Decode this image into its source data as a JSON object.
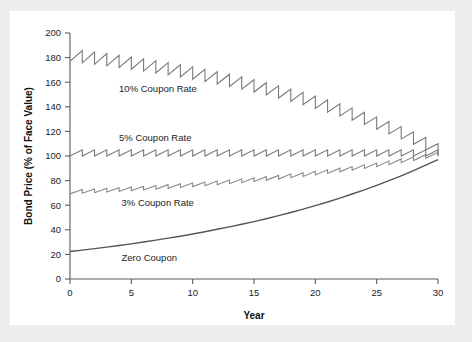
{
  "figure": {
    "panel_background": "#ffffff",
    "page_background": "#eceef0"
  },
  "chart_data": {
    "type": "line",
    "title": "",
    "subtitle": "",
    "xlabel": "Year",
    "ylabel": "Bond Price (% of Face Value)",
    "xlim": [
      0,
      30
    ],
    "ylim": [
      0,
      200
    ],
    "xticks": [
      0,
      5,
      10,
      15,
      20,
      25,
      30
    ],
    "xtick_labels": [
      "0",
      "5",
      "10",
      "15",
      "20",
      "25",
      "30"
    ],
    "yticks": [
      0,
      20,
      40,
      60,
      80,
      100,
      120,
      140,
      160,
      180,
      200
    ],
    "ytick_labels": [
      "0",
      "20",
      "40",
      "60",
      "80",
      "100",
      "120",
      "140",
      "160",
      "180",
      "200"
    ],
    "grid": false,
    "legend_position": "inline-annotations",
    "axis_color": "#5a5a5a",
    "series": [
      {
        "name": "10% Coupon Rate",
        "label": "10% Coupon Rate",
        "color": "#7a7a7a",
        "line_width": 1.1,
        "style": "sawtooth",
        "coupon_rate": 10,
        "yield": 5,
        "face_value": 100,
        "label_x": 4.0,
        "label_y": 152,
        "x": [
          0,
          1,
          2,
          3,
          4,
          5,
          6,
          7,
          8,
          9,
          10,
          11,
          12,
          13,
          14,
          15,
          16,
          17,
          18,
          19,
          20,
          21,
          22,
          23,
          24,
          25,
          26,
          27,
          28,
          29,
          30
        ],
        "values": [
          176.9,
          175.7,
          174.5,
          173.3,
          171.9,
          170.5,
          169.0,
          167.5,
          165.9,
          164.2,
          162.4,
          160.5,
          158.5,
          156.5,
          154.3,
          152.0,
          149.6,
          147.1,
          144.4,
          141.7,
          138.7,
          135.7,
          132.5,
          129.1,
          125.6,
          121.8,
          118.0,
          113.9,
          109.5,
          105.0,
          100.0
        ],
        "ex_coupon_values": [
          176.9,
          185.7,
          184.5,
          183.3,
          181.9,
          180.5,
          179.0,
          177.5,
          175.9,
          174.2,
          172.4,
          170.5,
          168.5,
          166.5,
          164.3,
          162.0,
          159.6,
          157.1,
          154.4,
          151.7,
          148.7,
          145.7,
          142.5,
          139.1,
          135.6,
          131.8,
          128.0,
          123.9,
          119.5,
          115.0,
          110.0
        ]
      },
      {
        "name": "5% Coupon Rate",
        "label": "5% Coupon Rate",
        "color": "#7a7a7a",
        "line_width": 1.1,
        "style": "sawtooth",
        "coupon_rate": 5,
        "yield": 5,
        "face_value": 100,
        "label_x": 4.0,
        "label_y": 112,
        "x": [
          0,
          1,
          2,
          3,
          4,
          5,
          6,
          7,
          8,
          9,
          10,
          11,
          12,
          13,
          14,
          15,
          16,
          17,
          18,
          19,
          20,
          21,
          22,
          23,
          24,
          25,
          26,
          27,
          28,
          29,
          30
        ],
        "values": [
          100,
          100,
          100,
          100,
          100,
          100,
          100,
          100,
          100,
          100,
          100,
          100,
          100,
          100,
          100,
          100,
          100,
          100,
          100,
          100,
          100,
          100,
          100,
          100,
          100,
          100,
          100,
          100,
          100,
          100,
          100
        ],
        "ex_coupon_values": [
          100,
          105,
          105,
          105,
          105,
          105,
          105,
          105,
          105,
          105,
          105,
          105,
          105,
          105,
          105,
          105,
          105,
          105,
          105,
          105,
          105,
          105,
          105,
          105,
          105,
          105,
          105,
          105,
          105,
          105,
          105
        ]
      },
      {
        "name": "3% Coupon Rate",
        "label": "3% Coupon Rate",
        "color": "#8a8a8a",
        "line_width": 1.1,
        "style": "sawtooth",
        "coupon_rate": 3,
        "yield": 5,
        "face_value": 100,
        "label_x": 4.2,
        "label_y": 59,
        "x": [
          0,
          1,
          2,
          3,
          4,
          5,
          6,
          7,
          8,
          9,
          10,
          11,
          12,
          13,
          14,
          15,
          16,
          17,
          18,
          19,
          20,
          21,
          22,
          23,
          24,
          25,
          26,
          27,
          28,
          29,
          30
        ],
        "values": [
          69.2,
          69.7,
          70.2,
          70.7,
          71.2,
          71.8,
          72.4,
          73.0,
          73.7,
          74.4,
          75.1,
          75.8,
          76.6,
          77.5,
          78.3,
          79.3,
          80.2,
          81.2,
          82.3,
          83.4,
          84.6,
          85.8,
          87.1,
          88.4,
          89.9,
          91.3,
          92.9,
          94.6,
          96.3,
          98.1,
          100.0
        ],
        "ex_coupon_values": [
          69.2,
          72.7,
          73.2,
          73.7,
          74.2,
          74.8,
          75.4,
          76.0,
          76.7,
          77.4,
          78.1,
          78.8,
          79.6,
          80.5,
          81.3,
          82.3,
          83.2,
          84.2,
          85.3,
          86.4,
          87.6,
          88.8,
          90.1,
          91.4,
          92.9,
          94.3,
          95.9,
          97.6,
          99.3,
          101.1,
          103.0
        ]
      },
      {
        "name": "Zero Coupon",
        "label": "Zero Coupon",
        "color": "#555555",
        "line_width": 1.4,
        "style": "smooth",
        "coupon_rate": 0,
        "yield": 5,
        "face_value": 100,
        "label_x": 4.2,
        "label_y": 15,
        "x": [
          0,
          1,
          2,
          3,
          4,
          5,
          6,
          7,
          8,
          9,
          10,
          11,
          12,
          13,
          14,
          15,
          16,
          17,
          18,
          19,
          20,
          21,
          22,
          23,
          24,
          25,
          26,
          27,
          28,
          29,
          30
        ],
        "values": [
          22.4,
          23.5,
          24.7,
          25.9,
          27.2,
          28.6,
          30.1,
          31.6,
          33.2,
          34.8,
          36.6,
          38.4,
          40.4,
          42.4,
          44.5,
          46.7,
          49.0,
          51.5,
          54.1,
          56.8,
          59.7,
          62.6,
          65.8,
          69.1,
          72.5,
          76.1,
          79.9,
          83.9,
          88.1,
          92.5,
          97.0
        ]
      }
    ]
  }
}
